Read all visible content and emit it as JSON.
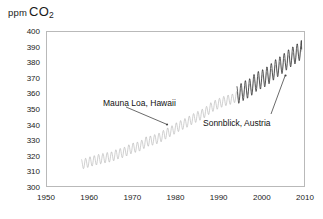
{
  "chart_data": {
    "type": "line",
    "title": "",
    "ylabel": "ppm CO2",
    "ylabel_prefix": "ppm",
    "ylabel_main": "CO",
    "ylabel_sub": "2",
    "xlabel": "",
    "xlim": [
      1950,
      2010
    ],
    "ylim": [
      300,
      400
    ],
    "grid": false,
    "legend_position": "none",
    "yticks": [
      300,
      310,
      320,
      330,
      340,
      350,
      360,
      370,
      380,
      390,
      400
    ],
    "xticks": [
      1950,
      1960,
      1970,
      1980,
      1990,
      2000,
      2010
    ],
    "x_minor_step": 2,
    "series": [
      {
        "name": "Mauna Loa, Hawaii",
        "color": "#b0b0b0",
        "x_start": 1958,
        "x_end": 2009,
        "seasonal_amplitude": 3.2,
        "x": [
          1958,
          1959,
          1960,
          1961,
          1962,
          1963,
          1964,
          1965,
          1966,
          1967,
          1968,
          1969,
          1970,
          1971,
          1972,
          1973,
          1974,
          1975,
          1976,
          1977,
          1978,
          1979,
          1980,
          1981,
          1982,
          1983,
          1984,
          1985,
          1986,
          1987,
          1988,
          1989,
          1990,
          1991,
          1992,
          1993,
          1994,
          1995,
          1996,
          1997,
          1998,
          1999,
          2000,
          2001,
          2002,
          2003,
          2004,
          2005,
          2006,
          2007,
          2008,
          2009
        ],
        "values": [
          315.3,
          315.9,
          316.9,
          317.6,
          318.4,
          319.0,
          319.6,
          320.0,
          321.4,
          322.2,
          323.0,
          324.6,
          325.7,
          326.3,
          327.5,
          329.7,
          330.2,
          331.1,
          332.0,
          333.8,
          335.4,
          336.8,
          338.7,
          340.1,
          341.4,
          343.0,
          344.6,
          346.0,
          347.4,
          349.2,
          351.6,
          353.1,
          354.4,
          355.6,
          356.4,
          357.1,
          358.8,
          360.8,
          362.6,
          363.7,
          366.7,
          368.4,
          369.5,
          371.0,
          373.1,
          375.6,
          377.4,
          379.6,
          381.8,
          383.7,
          385.6,
          387.4
        ]
      },
      {
        "name": "Sonnblick, Austria",
        "color": "#1d1d1d",
        "x_start": 1994,
        "x_end": 2009,
        "seasonal_amplitude": 6.0,
        "x": [
          1994,
          1995,
          1996,
          1997,
          1998,
          1999,
          2000,
          2001,
          2002,
          2003,
          2004,
          2005,
          2006,
          2007,
          2008,
          2009
        ],
        "values": [
          359.5,
          361.2,
          363.0,
          364.2,
          367.0,
          368.9,
          370.0,
          371.8,
          374.0,
          376.5,
          378.3,
          380.5,
          382.8,
          384.6,
          386.6,
          388.8
        ]
      }
    ],
    "annotations": [
      {
        "text": "Mauna Loa, Hawaii",
        "target_series": "Mauna Loa, Hawaii"
      },
      {
        "text": "Sonnblick, Austria",
        "target_series": "Sonnblick, Austria"
      }
    ]
  },
  "axis": {
    "y_title_ppm": "ppm",
    "y_title_co2": "CO",
    "y_title_sub": "2",
    "ytick_labels": [
      "400",
      "390",
      "380",
      "370",
      "360",
      "350",
      "340",
      "330",
      "320",
      "310",
      "300"
    ],
    "xtick_labels": [
      "1950",
      "1960",
      "1970",
      "1980",
      "1990",
      "2000",
      "2010"
    ]
  },
  "annotations": {
    "mauna": "Mauna Loa, Hawaii",
    "sonnblick": "Sonnblick, Austria"
  },
  "colors": {
    "mauna_loa": "#b0b0b0",
    "sonnblick": "#1d1d1d",
    "frame": "#b9b9b9",
    "tick": "#8f8f8f",
    "text": "#1a1a1a"
  }
}
